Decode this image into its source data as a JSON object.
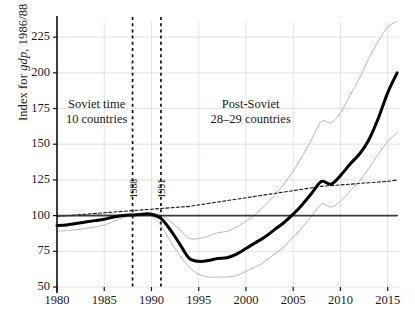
{
  "chart_data": {
    "type": "line",
    "title": "",
    "xlabel": "",
    "ylabel": "Index for gdp, 1986/88 = 100",
    "ylabel_parts": {
      "pre": "Index for ",
      "italic": "gdp",
      "post": ", 1986/88 = 100"
    },
    "xlim": [
      1980,
      2016
    ],
    "ylim": [
      50,
      235
    ],
    "xticks": [
      1980,
      1985,
      1990,
      1995,
      2000,
      2005,
      2010,
      2015
    ],
    "yticks": [
      50,
      75,
      100,
      125,
      150,
      175,
      200,
      225
    ],
    "grid": true,
    "legend_position": "none",
    "reference_line_y": 100,
    "vertical_markers": [
      {
        "x": 1988,
        "label": "1988",
        "style": "dashed"
      },
      {
        "x": 1991,
        "label": "1991",
        "style": "dashed"
      }
    ],
    "annotations": [
      {
        "text_line1": "Soviet time",
        "text_line2": "10 countries",
        "x": 1984.2,
        "y": 172
      },
      {
        "text_line1": "Post-Soviet",
        "text_line2": "28–29 countries",
        "x": 2000.5,
        "y": 172
      }
    ],
    "x": [
      1980,
      1981,
      1982,
      1983,
      1984,
      1985,
      1986,
      1987,
      1988,
      1989,
      1990,
      1991,
      1992,
      1993,
      1994,
      1995,
      1996,
      1997,
      1998,
      1999,
      2000,
      2001,
      2002,
      2003,
      2004,
      2005,
      2006,
      2007,
      2008,
      2009,
      2010,
      2011,
      2012,
      2013,
      2014,
      2015,
      2016
    ],
    "series": [
      {
        "name": "median",
        "style": "solid-bold",
        "color": "#000000",
        "values": [
          93,
          93.5,
          94.5,
          95.5,
          96.5,
          97.5,
          99,
          100,
          100.5,
          101,
          101,
          98,
          90,
          80,
          70,
          68,
          68.5,
          70,
          70.5,
          73,
          77,
          81,
          85,
          90,
          95,
          101,
          108,
          116,
          124,
          122,
          128,
          136,
          143,
          153,
          168,
          186,
          200
        ]
      },
      {
        "name": "upper-band",
        "style": "solid-thin",
        "color": "#b0b0b0",
        "values": [
          99.5,
          99.5,
          100,
          100.5,
          100.5,
          101,
          101,
          100.5,
          100.5,
          101,
          101.5,
          100.5,
          96,
          90,
          84,
          84,
          85.5,
          88,
          89,
          92,
          96,
          101,
          107,
          114,
          122,
          131,
          142,
          154,
          166,
          165,
          172,
          184,
          196,
          210,
          222,
          232,
          236
        ]
      },
      {
        "name": "lower-band",
        "style": "solid-thin",
        "color": "#b0b0b0",
        "values": [
          89,
          89.5,
          90,
          91,
          92,
          93.5,
          96,
          98.5,
          100,
          100.5,
          100,
          93,
          82,
          72,
          64,
          59,
          57,
          57,
          57,
          58,
          61,
          64,
          68,
          73,
          78,
          85,
          92,
          100,
          108,
          106,
          110,
          117,
          124,
          133,
          143,
          152,
          158
        ]
      },
      {
        "name": "trend",
        "style": "dashed-thin",
        "color": "#1a1a1a",
        "values": [
          99.5,
          100,
          100.5,
          101,
          101.5,
          102,
          102.5,
          103,
          103.5,
          104,
          104.5,
          105,
          105.5,
          106,
          106.5,
          107.5,
          108.5,
          109.5,
          110.5,
          111.5,
          112.5,
          113.5,
          114.5,
          115.5,
          116.5,
          117.5,
          118.5,
          119.5,
          120.5,
          121,
          121.5,
          122,
          122.5,
          123,
          123.5,
          124,
          125
        ]
      },
      {
        "name": "baseline-100",
        "style": "solid-medium",
        "color": "#3b3b3b",
        "values": [
          100,
          100,
          100,
          100,
          100,
          100,
          100,
          100,
          100,
          100,
          100,
          100,
          100,
          100,
          100,
          100,
          100,
          100,
          100,
          100,
          100,
          100,
          100,
          100,
          100,
          100,
          100,
          100,
          100,
          100,
          100,
          100,
          100,
          100,
          100,
          100,
          100
        ]
      }
    ]
  }
}
